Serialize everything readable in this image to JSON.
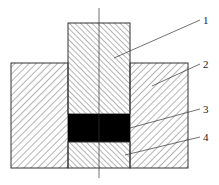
{
  "figure": {
    "type": "cross-section mechanical drawing",
    "parts": [
      {
        "id": "1",
        "label": "1",
        "name": "central-rod"
      },
      {
        "id": "2",
        "label": "2",
        "name": "outer-base"
      },
      {
        "id": "3",
        "label": "3",
        "name": "black-insert"
      },
      {
        "id": "4",
        "label": "4",
        "name": "lower-rod-section"
      }
    ],
    "colors": {
      "line": "#333333",
      "fill_dark": "#000000",
      "background": "#ffffff"
    }
  }
}
